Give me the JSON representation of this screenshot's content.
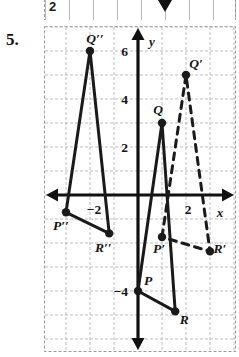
{
  "top_strip": {
    "visible_number": "2",
    "arrow_icon": "down-triangle-icon"
  },
  "problem": {
    "number": "5."
  },
  "chart_data": {
    "type": "scatter",
    "title": "",
    "subtitle": "",
    "xlabel": "x",
    "ylabel": "y",
    "xlim": [
      -4,
      4
    ],
    "ylim": [
      -5.6,
      7.2
    ],
    "grid": true,
    "grid_step": 1,
    "legend": "none",
    "x_tick_labels": [
      "-2",
      "2"
    ],
    "x_tick_values": [
      -2,
      2
    ],
    "y_tick_labels": [
      "6",
      "4",
      "2",
      "-4"
    ],
    "y_tick_values": [
      6,
      4,
      2,
      -4
    ],
    "axis_arrows": [
      "left",
      "right",
      "up",
      "down"
    ],
    "series": [
      {
        "name": "Triangle PQR",
        "style": "solid",
        "color": "#1a1a1a",
        "closed": true,
        "points": [
          {
            "label": "P",
            "x": 0,
            "y": -4,
            "label_dx": 10,
            "label_dy": -6
          },
          {
            "label": "Q",
            "x": 1,
            "y": 3,
            "label_dx": -4,
            "label_dy": -9
          },
          {
            "label": "R",
            "x": 1.55,
            "y": -4.85,
            "label_dx": 9,
            "label_dy": 13
          }
        ]
      },
      {
        "name": "Triangle P'Q'R'",
        "style": "dashed",
        "color": "#1a1a1a",
        "closed": true,
        "points": [
          {
            "label": "P'",
            "x": 1,
            "y": -1.75,
            "label_dx": -3,
            "label_dy": 16
          },
          {
            "label": "Q'",
            "x": 2,
            "y": 5,
            "label_dx": 10,
            "label_dy": -7
          },
          {
            "label": "R'",
            "x": 3,
            "y": -2.35,
            "label_dx": 10,
            "label_dy": 2
          }
        ]
      },
      {
        "name": "Triangle P''Q''R''",
        "style": "solid",
        "color": "#1a1a1a",
        "closed": true,
        "points": [
          {
            "label": "P''",
            "x": -3,
            "y": -0.72,
            "label_dx": -5,
            "label_dy": 18
          },
          {
            "label": "Q''",
            "x": -2,
            "y": 6,
            "label_dx": 5,
            "label_dy": -8
          },
          {
            "label": "R''",
            "x": -1.2,
            "y": -1.6,
            "label_dx": -6,
            "label_dy": 19
          }
        ]
      }
    ]
  }
}
